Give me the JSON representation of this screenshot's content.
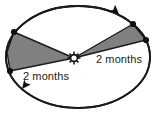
{
  "figure": {
    "kind": "orbit-equal-areas-diagram",
    "background_color": "#ffffff",
    "stroke_color": "#1a1a1a",
    "wedge_fill_color": "#808080",
    "wedge_stroke_color": "#1a1a1a",
    "marker_color": "#111111",
    "text_color": "#1a1a1a"
  },
  "labels": {
    "left_sector": "2 months",
    "right_sector": "2 months"
  },
  "orbit": {
    "center_x": 78,
    "center_y": 57,
    "radius_x": 72,
    "radius_y": 51,
    "stroke_width": 1.8
  },
  "sun": {
    "x": 74,
    "y": 58,
    "radius": 3.4,
    "ray_count": 8
  },
  "sectors": [
    {
      "name": "left-sector",
      "points": "74,58 14,32 7,52 10,71",
      "label": "2 months"
    },
    {
      "name": "right-sector",
      "points": "74,58 133,24 146,40",
      "label": "2 months"
    }
  ],
  "planet_markers": [
    {
      "name": "planet-marker-upper-left",
      "x": 14,
      "y": 32
    },
    {
      "name": "planet-marker-lower-left",
      "x": 10,
      "y": 71
    },
    {
      "name": "planet-marker-upper-right",
      "x": 133,
      "y": 24
    },
    {
      "name": "planet-marker-lower-right",
      "x": 146,
      "y": 40
    }
  ],
  "direction_arrows": [
    {
      "name": "arrowhead-top-right",
      "x": 119,
      "y": 14,
      "angle": 42
    },
    {
      "name": "arrowhead-bottom-left",
      "x": 22,
      "y": 89,
      "angle": 128
    }
  ]
}
